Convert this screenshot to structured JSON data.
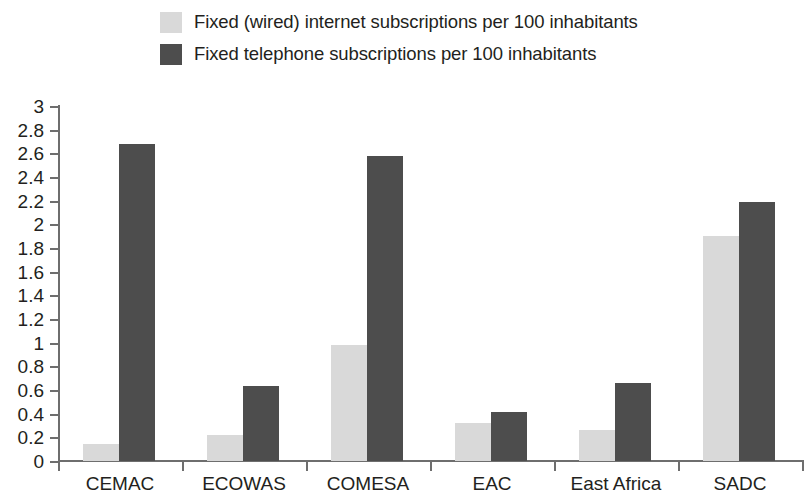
{
  "chart_data": {
    "type": "bar",
    "title": "",
    "subtitle": "",
    "xlabel": "",
    "ylabel": "",
    "categories": [
      "CEMAC",
      "ECOWAS",
      "COMESA",
      "EAC",
      "East Africa",
      "SADC"
    ],
    "series": [
      {
        "name": "Fixed (wired) internet subscriptions per 100 inhabitants",
        "color": "#d9d9d9",
        "values": [
          0.14,
          0.22,
          0.98,
          0.32,
          0.26,
          1.9
        ]
      },
      {
        "name": "Fixed telephone subscriptions per 100 inhabitants",
        "color": "#4d4d4d",
        "values": [
          2.68,
          0.63,
          2.58,
          0.41,
          0.66,
          2.19
        ]
      }
    ],
    "ylim": [
      0,
      3
    ],
    "ytick_step": 0.2,
    "yticks": [
      "0",
      "0.2",
      "0.4",
      "0.6",
      "0.8",
      "1",
      "1.2",
      "1.4",
      "1.6",
      "1.8",
      "2",
      "2.2",
      "2.4",
      "2.6",
      "2.8",
      "3"
    ],
    "grid": false,
    "legend_position": "top"
  },
  "legend": {
    "items": [
      {
        "label": "Fixed (wired) internet subscriptions per 100 inhabitants",
        "color": "#d9d9d9"
      },
      {
        "label": "Fixed telephone subscriptions per 100 inhabitants",
        "color": "#4d4d4d"
      }
    ]
  },
  "axis": {
    "line_color": "#6e6e6e",
    "text_color": "#231f20"
  }
}
